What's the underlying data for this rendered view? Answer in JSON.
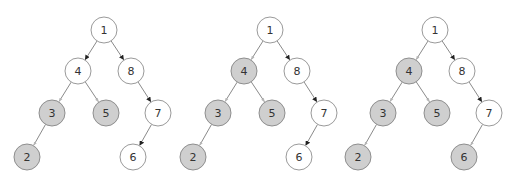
{
  "colors": {
    "background": "#ffffff",
    "visited_fill": "#cfcfcf",
    "visited_stroke": "#8e8e8e",
    "unvisited_fill": "#ffffff",
    "unvisited_stroke": "#9a9a9a",
    "edge": "#8a8a8a",
    "arrow_dark": "#222222",
    "label": "#333333"
  },
  "tree": {
    "node_radius": 13,
    "nodes": [
      {
        "id": "1",
        "label": "1",
        "x": 104,
        "y": 30
      },
      {
        "id": "4",
        "label": "4",
        "x": 78,
        "y": 71
      },
      {
        "id": "8",
        "label": "8",
        "x": 131,
        "y": 71
      },
      {
        "id": "3",
        "label": "3",
        "x": 52,
        "y": 113
      },
      {
        "id": "5",
        "label": "5",
        "x": 106,
        "y": 113
      },
      {
        "id": "7",
        "label": "7",
        "x": 158,
        "y": 113
      },
      {
        "id": "2",
        "label": "2",
        "x": 27,
        "y": 157
      },
      {
        "id": "6",
        "label": "6",
        "x": 133,
        "y": 157
      }
    ],
    "edges": [
      {
        "from": "1",
        "to": "4"
      },
      {
        "from": "1",
        "to": "8"
      },
      {
        "from": "4",
        "to": "3"
      },
      {
        "from": "4",
        "to": "5"
      },
      {
        "from": "8",
        "to": "7"
      },
      {
        "from": "3",
        "to": "2"
      },
      {
        "from": "7",
        "to": "6"
      }
    ]
  },
  "panels": [
    {
      "name": "panel-1",
      "offset_x": 0,
      "visited": [
        "3",
        "5",
        "2"
      ]
    },
    {
      "name": "panel-2",
      "offset_x": 166,
      "visited": [
        "4",
        "3",
        "5",
        "2"
      ]
    },
    {
      "name": "panel-3",
      "offset_x": 331,
      "visited": [
        "4",
        "3",
        "5",
        "2",
        "6"
      ]
    }
  ]
}
